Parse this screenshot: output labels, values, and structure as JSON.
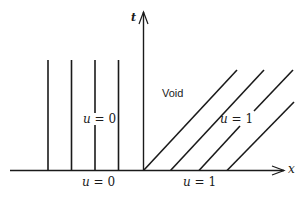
{
  "diagram": {
    "type": "characteristics-xt-plane",
    "axes": {
      "horizontal_label": "x",
      "vertical_label": "t"
    },
    "regions": {
      "left_region_label": "u = 0",
      "void_label": "Void",
      "right_region_label": "u = 1"
    },
    "initial_data": {
      "left_label": "u = 0",
      "right_label": "u = 1"
    },
    "labels": {
      "left_region": {
        "var": "u",
        "eq": " = ",
        "val": "0"
      },
      "right_region": {
        "var": "u",
        "eq": " = ",
        "val": "1"
      },
      "left_initial": {
        "var": "u",
        "eq": " = ",
        "val": "0"
      },
      "right_initial": {
        "var": "u",
        "eq": " = ",
        "val": "1"
      },
      "void": "Void",
      "x_axis": "x",
      "t_axis": "t"
    },
    "vertical_characteristics_count": 4,
    "slanted_characteristics_count": 4,
    "colors": {
      "ink": "#1a1a1a",
      "background": "#ffffff"
    }
  }
}
